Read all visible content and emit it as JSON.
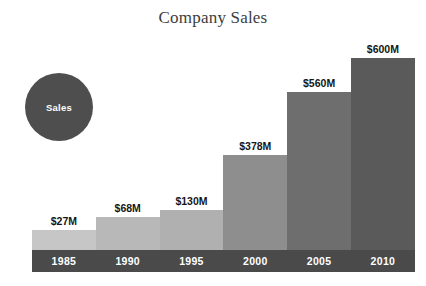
{
  "chart_data": {
    "type": "bar",
    "title": "Company Sales",
    "xlabel": "",
    "ylabel": "",
    "categories": [
      "1985",
      "1990",
      "1995",
      "2000",
      "2005",
      "2010"
    ],
    "values": [
      27,
      68,
      130,
      378,
      560,
      600
    ],
    "value_labels": [
      "$27M",
      "$68M",
      "$130M",
      "$378M",
      "$560M",
      "$600M"
    ],
    "bar_colors": [
      "#c6c6c6",
      "#b8b8b8",
      "#b0b0b0",
      "#8e8e8e",
      "#6e6e6e",
      "#5a5a5a"
    ],
    "ylim": [
      0,
      600
    ],
    "grid": false,
    "legend": {
      "position": "top-left",
      "entries": [
        "Sales"
      ],
      "marker_shape": "circle",
      "marker_color": "#4e4e4e",
      "marker_text_color": "#ffffff"
    },
    "axis_band_color": "#4a4a4a",
    "axis_label_color": "#ffffff",
    "title_color": "#3d3d3d",
    "value_label_color": "#161616",
    "background": "#ffffff"
  },
  "legend": {
    "sales_label": "Sales"
  },
  "bars": [
    {
      "year": "1985",
      "value_label": "$27M",
      "value": 27,
      "color": "#c6c6c6",
      "height_px": 20
    },
    {
      "year": "1990",
      "value_label": "$68M",
      "value": 68,
      "color": "#b8b8b8",
      "height_px": 33
    },
    {
      "year": "1995",
      "value_label": "$130M",
      "value": 130,
      "color": "#b0b0b0",
      "height_px": 40
    },
    {
      "year": "2000",
      "value_label": "$378M",
      "value": 378,
      "color": "#8e8e8e",
      "height_px": 95
    },
    {
      "year": "2005",
      "value_label": "$560M",
      "value": 560,
      "color": "#6e6e6e",
      "height_px": 158
    },
    {
      "year": "2010",
      "value_label": "$600M",
      "value": 600,
      "color": "#5a5a5a",
      "height_px": 192
    }
  ]
}
